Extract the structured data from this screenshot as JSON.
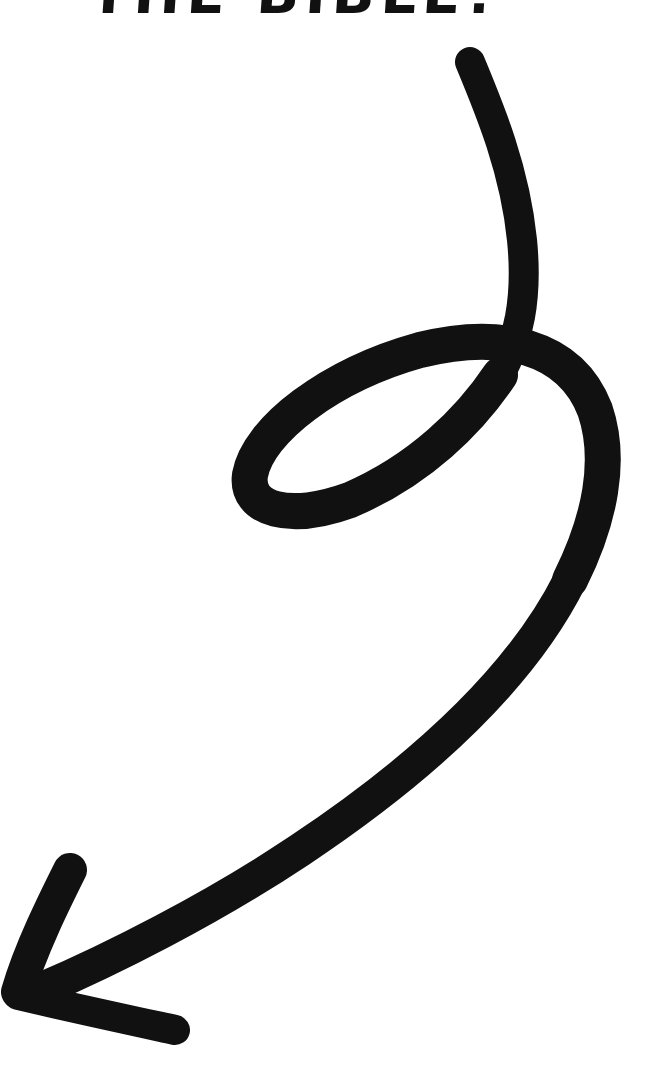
{
  "caption": {
    "text": "THE BIBLE!",
    "cropped": true
  },
  "arrow": {
    "icon": "swirl-arrow-icon",
    "direction": "down-left",
    "color": "#111111"
  },
  "background": "#ffffff"
}
